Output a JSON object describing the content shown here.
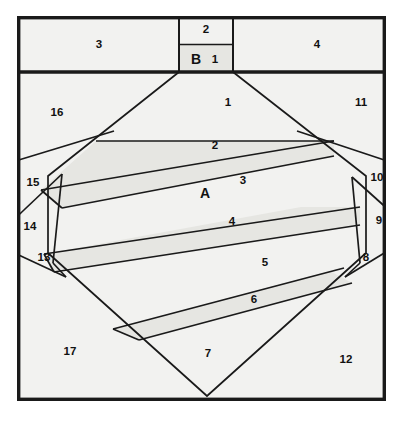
{
  "figure": {
    "background_color": "#ffffff",
    "region_fill_color": "#f2f2f0",
    "stripe_fill_color": "#e6e6e2",
    "line_color": "#1a1a1a"
  },
  "labels": {
    "A": "A",
    "B": "B",
    "n1": "1",
    "n2": "2",
    "n3": "3",
    "n4": "4",
    "n5": "5",
    "n6": "6",
    "n7": "7",
    "n8": "8",
    "n9": "9",
    "n10": "10",
    "n11": "11",
    "n12": "12",
    "n13": "13",
    "n14": "14",
    "n15": "15",
    "n16": "16",
    "n17": "17",
    "top_strip_left": "3",
    "top_strip_right": "4",
    "top_box_upper": "2",
    "top_box_lower_letter": "B",
    "top_box_lower_number": "1"
  },
  "regions": [
    {
      "id": "A",
      "label": "A",
      "kind": "interior-large",
      "x": 213,
      "y": 193
    },
    {
      "id": "B",
      "label": "B",
      "kind": "top-box-lower",
      "x": 196,
      "y": 61
    },
    {
      "id": "r1_box",
      "label": "1",
      "kind": "top-box-lower",
      "x": 215,
      "y": 61
    },
    {
      "id": "r2_box",
      "label": "2",
      "kind": "top-box-upper",
      "x": 206,
      "y": 29
    },
    {
      "id": "r3_strip",
      "label": "3",
      "kind": "top-strip-left",
      "x": 99,
      "y": 44
    },
    {
      "id": "r4_strip",
      "label": "4",
      "kind": "top-strip-right",
      "x": 317,
      "y": 44
    },
    {
      "id": "r1",
      "label": "1",
      "kind": "octagon-band",
      "x": 228,
      "y": 103
    },
    {
      "id": "r2",
      "label": "2",
      "kind": "octagon-stripe",
      "x": 215,
      "y": 146
    },
    {
      "id": "r3",
      "label": "3",
      "kind": "octagon-band",
      "x": 243,
      "y": 181
    },
    {
      "id": "r4",
      "label": "4",
      "kind": "octagon-stripe",
      "x": 232,
      "y": 222
    },
    {
      "id": "r5",
      "label": "5",
      "kind": "octagon-band",
      "x": 265,
      "y": 263
    },
    {
      "id": "r6",
      "label": "6",
      "kind": "octagon-stripe",
      "x": 254,
      "y": 300
    },
    {
      "id": "r7",
      "label": "7",
      "kind": "octagon-band",
      "x": 208,
      "y": 354
    },
    {
      "id": "r8",
      "label": "8",
      "kind": "corner-right",
      "x": 366,
      "y": 258
    },
    {
      "id": "r9",
      "label": "9",
      "kind": "corner-right",
      "x": 379,
      "y": 221
    },
    {
      "id": "r10",
      "label": "10",
      "kind": "corner-right",
      "x": 377,
      "y": 178
    },
    {
      "id": "r11",
      "label": "11",
      "kind": "outer-corner",
      "x": 361,
      "y": 103
    },
    {
      "id": "r12",
      "label": "12",
      "kind": "outer-corner",
      "x": 346,
      "y": 360
    },
    {
      "id": "r13",
      "label": "13",
      "kind": "corner-left",
      "x": 44,
      "y": 258
    },
    {
      "id": "r14",
      "label": "14",
      "kind": "corner-left",
      "x": 30,
      "y": 227
    },
    {
      "id": "r15",
      "label": "15",
      "kind": "corner-left",
      "x": 33,
      "y": 183
    },
    {
      "id": "r16",
      "label": "16",
      "kind": "outer-corner",
      "x": 57,
      "y": 113
    },
    {
      "id": "r17",
      "label": "17",
      "kind": "outer-corner",
      "x": 70,
      "y": 352
    }
  ],
  "geometry": {
    "frame": {
      "x1": 17,
      "y1": 16,
      "x2": 386,
      "y2": 401
    },
    "top_strip_bottom_y": 72,
    "top_box": {
      "x1": 179,
      "x2": 233,
      "divider_y": 44
    },
    "octagon_vertices": [
      [
        179,
        72
      ],
      [
        233,
        72
      ],
      [
        331,
        134
      ],
      [
        366,
        176
      ],
      [
        366,
        253
      ],
      [
        207,
        396
      ],
      [
        48,
        253
      ],
      [
        48,
        176
      ]
    ]
  }
}
